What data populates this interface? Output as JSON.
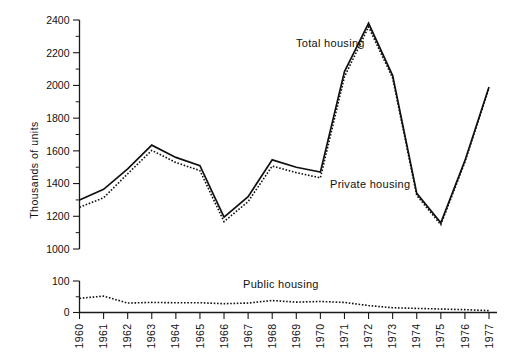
{
  "chart_data": {
    "type": "line",
    "title": "",
    "xlabel": "",
    "ylabel": "Thousands of units",
    "categories": [
      "1960",
      "1961",
      "1962",
      "1963",
      "1964",
      "1965",
      "1966",
      "1967",
      "1968",
      "1969",
      "1970",
      "1971",
      "1972",
      "1973",
      "1974",
      "1975",
      "1976",
      "1977"
    ],
    "panels": [
      {
        "name": "upper-panel",
        "ylabel": "Thousands of units",
        "ylim": [
          1000,
          2400
        ],
        "ytick_labels": [
          "1000",
          "1200",
          "1400",
          "1600",
          "1800",
          "2000",
          "2200",
          "2400"
        ],
        "ytick_values": [
          1000,
          1200,
          1400,
          1600,
          1800,
          2000,
          2200,
          2400
        ],
        "yminor_step": 100,
        "grid": false,
        "series": [
          {
            "name": "Total housing",
            "style": "solid",
            "label": "Total housing",
            "values": [
              1300,
              1365,
              1490,
              1635,
              1560,
              1510,
              1195,
              1320,
              1545,
              1500,
              1470,
              2085,
              2380,
              2060,
              1340,
              1160,
              1540,
              1990
            ]
          },
          {
            "name": "Private housing",
            "style": "dotted",
            "label": "Private housing",
            "values": [
              1255,
              1313,
              1460,
              1603,
              1529,
              1479,
              1167,
              1290,
              1507,
              1467,
              1435,
              2053,
              2358,
              2045,
              1327,
              1149,
              1531,
              1984
            ]
          }
        ]
      },
      {
        "name": "lower-panel",
        "ylabel": "",
        "ylim": [
          0,
          100
        ],
        "ytick_labels": [
          "0",
          "100"
        ],
        "ytick_values": [
          0,
          100
        ],
        "yminor_step": 50,
        "grid": false,
        "series": [
          {
            "name": "Public housing",
            "style": "dotted",
            "label": "Public housing",
            "values": [
              45,
              52,
              30,
              32,
              31,
              31,
              28,
              30,
              38,
              33,
              35,
              32,
              22,
              15,
              13,
              11,
              9,
              6
            ]
          }
        ]
      }
    ],
    "legend_position": "inline-annotations",
    "annotations": [
      {
        "text": "Total housing",
        "panel": "upper-panel",
        "near_year": "1971"
      },
      {
        "text": "Private housing",
        "panel": "upper-panel",
        "near_year": "1970"
      },
      {
        "text": "Public housing",
        "panel": "lower-panel",
        "near_year": "1969"
      }
    ]
  },
  "axis": {
    "y_title": "Thousands of units",
    "upper_ticks": [
      "2400",
      "2200",
      "2000",
      "1800",
      "1600",
      "1400",
      "1200",
      "1000"
    ],
    "lower_ticks": [
      "100",
      "0"
    ],
    "x_labels": [
      "1960",
      "1961",
      "1962",
      "1963",
      "1964",
      "1965",
      "1966",
      "1967",
      "1968",
      "1969",
      "1970",
      "1971",
      "1972",
      "1973",
      "1974",
      "1975",
      "1976",
      "1977"
    ]
  },
  "labels": {
    "total_housing": "Total housing",
    "private_housing": "Private housing",
    "public_housing": "Public housing"
  },
  "colors": {
    "ink": "#111111",
    "background": "#ffffff"
  }
}
